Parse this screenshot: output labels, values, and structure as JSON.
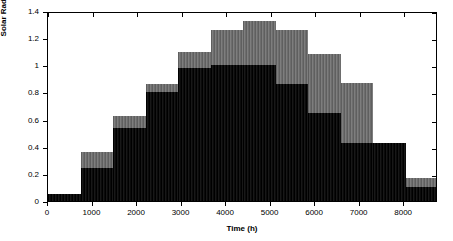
{
  "chart_data": {
    "type": "bar",
    "title": "",
    "xlabel": "Time (h)",
    "ylabel": "Solar Radiation (kWh/m2)",
    "xlim": [
      0,
      8760
    ],
    "ylim": [
      0,
      1.4
    ],
    "xticks": [
      0,
      1000,
      2000,
      3000,
      4000,
      5000,
      6000,
      7000,
      8000
    ],
    "xticklabels": [
      "0",
      "1000",
      "2000",
      "3000",
      "4000",
      "5000",
      "6000",
      "7000",
      "8000"
    ],
    "yticks": [
      0,
      0.2,
      0.4,
      0.6,
      0.8,
      1,
      1.2,
      1.4
    ],
    "yticklabels": [
      "0",
      "0.2",
      "0.4",
      "0.6",
      "0.8",
      "1",
      "1.2",
      "1.4"
    ],
    "grid": false,
    "legend": "none",
    "step_width_hours": 730,
    "categories": [
      "Jan",
      "Feb",
      "Mar",
      "Apr",
      "May",
      "Jun",
      "Jul",
      "Aug",
      "Sep",
      "Oct",
      "Nov",
      "Dec"
    ],
    "x_starts": [
      0,
      730,
      1460,
      2190,
      2920,
      3650,
      4380,
      5110,
      5840,
      6570,
      7300,
      8030
    ],
    "series": [
      {
        "name": "lower-dark-layer",
        "color": "#0a0a0a",
        "values": [
          0.05,
          0.24,
          0.54,
          0.8,
          0.98,
          1.0,
          1.0,
          0.86,
          0.65,
          0.43,
          0.43,
          0.1
        ]
      },
      {
        "name": "upper-gray-layer",
        "color": "#737373",
        "values": [
          0.05,
          0.36,
          0.63,
          0.86,
          1.1,
          1.26,
          1.33,
          1.26,
          1.08,
          0.87,
          0.43,
          0.17
        ]
      }
    ],
    "colors": {
      "dark": "#0a0a0a",
      "gray": "#737373",
      "axis": "#000000",
      "background": "#ffffff"
    }
  }
}
